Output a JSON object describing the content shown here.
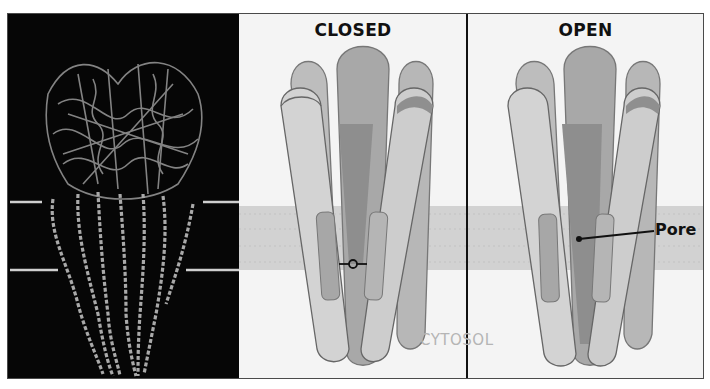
{
  "figure": {
    "structure_panel": {
      "description": "ribbon structure of channel protein",
      "membrane_marks": 4
    },
    "closed_panel": {
      "title": "CLOSED",
      "gate_icon": "closed-gate-icon"
    },
    "open_panel": {
      "title": "OPEN",
      "pore_label": "Pore"
    },
    "cytosol_label": "CYTOSOL",
    "colors": {
      "background": "#f4f4f4",
      "membrane": "#d2d2d2",
      "subunit_light": "#d4d4d4",
      "subunit_mid": "#b3b3b3",
      "subunit_dark": "#8c8c8c",
      "helix": "#a9a9a9",
      "structure_bg": "#060606"
    }
  }
}
